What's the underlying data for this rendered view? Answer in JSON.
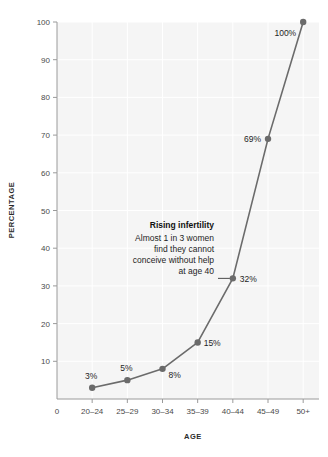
{
  "chart_data": {
    "type": "line",
    "title": "",
    "subtitle": "",
    "xlabel": "AGE",
    "ylabel": "PERCENTAGE",
    "categories": [
      "20–24",
      "25–29",
      "30–34",
      "35–39",
      "40–44",
      "45–49",
      "50+"
    ],
    "values": [
      3,
      5,
      8,
      15,
      32,
      69,
      100
    ],
    "point_labels": [
      "3%",
      "5%",
      "8%",
      "15%",
      "32%",
      "69%",
      "100%"
    ],
    "x_tick_labels": [
      "0",
      "20–24",
      "25–29",
      "30–34",
      "35–39",
      "40–44",
      "45–49",
      "50+"
    ],
    "y_tick_labels": [
      "10",
      "20",
      "30",
      "40",
      "50",
      "60",
      "70",
      "80",
      "90",
      "100"
    ],
    "y_ticks": [
      10,
      20,
      30,
      40,
      50,
      60,
      70,
      80,
      90,
      100
    ],
    "ylim": [
      0,
      100
    ],
    "grid": true,
    "legend": "none",
    "series": [
      {
        "name": "Infertility percentage by age",
        "values": [
          3,
          5,
          8,
          15,
          32,
          69,
          100
        ]
      }
    ],
    "annotations": [
      {
        "heading": "Rising infertility",
        "lines": [
          "Almost 1 in 3 women",
          "find they cannot",
          "conceive without help",
          "at age 40"
        ],
        "target_category": "40–44",
        "target_value": 32
      }
    ],
    "colors": {
      "line": "#6b6b6b",
      "marker": "#6b6b6b",
      "plot_background": "#f5f5f5",
      "gridline": "#ffffff",
      "axis": "#9a9a9a",
      "text": "#1e1e1e",
      "tick_text": "#4a4a4a"
    }
  }
}
